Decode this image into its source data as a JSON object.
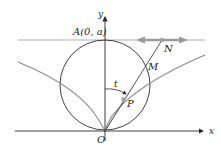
{
  "diagram": {
    "labels": {
      "point_A": "A(0, a)",
      "axis_y": "y",
      "axis_x": "x",
      "origin": "O",
      "point_N": "N",
      "point_M": "M",
      "point_P": "P",
      "angle_t": "t"
    },
    "colors": {
      "ink": "#2a2a2a",
      "curve": "#8a8a8a",
      "line_top": "#a8a8a8",
      "arrow": "#9a9a9a",
      "point": "#9a9a9a"
    }
  }
}
